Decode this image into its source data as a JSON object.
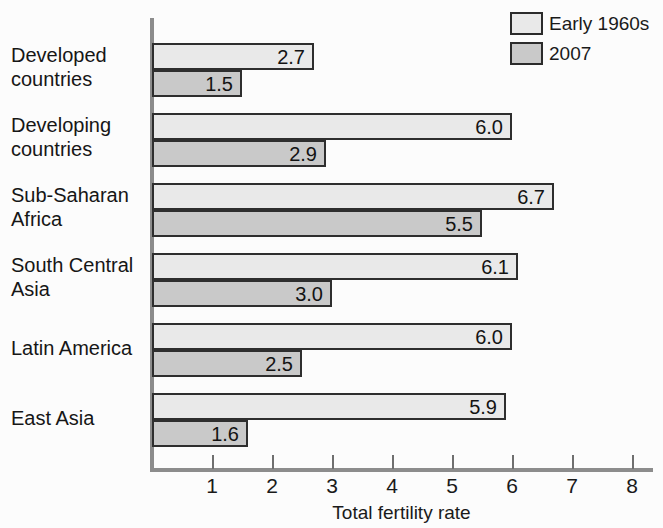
{
  "legend": {
    "items": [
      {
        "label": "Early 1960s",
        "color": "#e9e9e9",
        "swatch_name": "legend-swatch-early-1960s"
      },
      {
        "label": "2007",
        "color": "#c9c9c9",
        "swatch_name": "legend-swatch-2007"
      }
    ]
  },
  "axis": {
    "x_title": "Total fertility rate",
    "ticks": [
      "1",
      "2",
      "3",
      "4",
      "5",
      "6",
      "7",
      "8"
    ]
  },
  "chart_data": {
    "type": "bar",
    "orientation": "horizontal",
    "title": "",
    "subtitle": "",
    "xlabel": "Total fertility rate",
    "ylabel": "",
    "xlim": [
      0,
      8.4
    ],
    "xticks": [
      1,
      2,
      3,
      4,
      5,
      6,
      7,
      8
    ],
    "grid": false,
    "legend_position": "top-right",
    "categories": [
      "Developed countries",
      "Developing countries",
      "Sub-Saharan Africa",
      "South Central Asia",
      "Latin America",
      "East Asia"
    ],
    "series": [
      {
        "name": "Early 1960s",
        "color": "#e9e9e9",
        "values": [
          2.7,
          6.0,
          6.7,
          6.1,
          6.0,
          5.9
        ],
        "labels": [
          "2.7",
          "6.0",
          "6.7",
          "6.1",
          "6.0",
          "5.9"
        ]
      },
      {
        "name": "2007",
        "color": "#c9c9c9",
        "values": [
          1.5,
          2.9,
          5.5,
          3.0,
          2.5,
          1.6
        ],
        "labels": [
          "1.5",
          "2.9",
          "5.5",
          "3.0",
          "2.5",
          "1.6"
        ]
      }
    ]
  },
  "categories_display": [
    {
      "line1": "Developed",
      "line2": "countries"
    },
    {
      "line1": "Developing",
      "line2": "countries"
    },
    {
      "line1": "Sub-Saharan",
      "line2": "Africa"
    },
    {
      "line1": "South Central",
      "line2": "Asia"
    },
    {
      "line1": "Latin America",
      "line2": ""
    },
    {
      "line1": "East Asia",
      "line2": ""
    }
  ]
}
